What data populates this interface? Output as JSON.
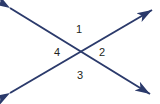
{
  "figure": {
    "name": "intersecting-lines-angle-diagram",
    "width": 160,
    "height": 104,
    "background_color": "#ffffff",
    "line_color": "#2b3a6b",
    "label_color": "#231f20",
    "line_width": 2,
    "intersection": {
      "x": 80,
      "y": 52
    }
  },
  "lines": [
    {
      "id": "line-falling",
      "description": "double-headed arrow from upper-left to lower-right",
      "from": {
        "x": 10,
        "y": 8
      },
      "to": {
        "x": 150,
        "y": 94
      },
      "arrow_start": true,
      "arrow_end": true
    },
    {
      "id": "line-rising",
      "description": "double-headed arrow from lower-left to upper-right",
      "from": {
        "x": 10,
        "y": 93
      },
      "to": {
        "x": 152,
        "y": 10
      },
      "arrow_start": true,
      "arrow_end": true
    }
  ],
  "labels": {
    "angle1": "1",
    "angle2": "2",
    "angle3": "3",
    "angle4": "4"
  }
}
